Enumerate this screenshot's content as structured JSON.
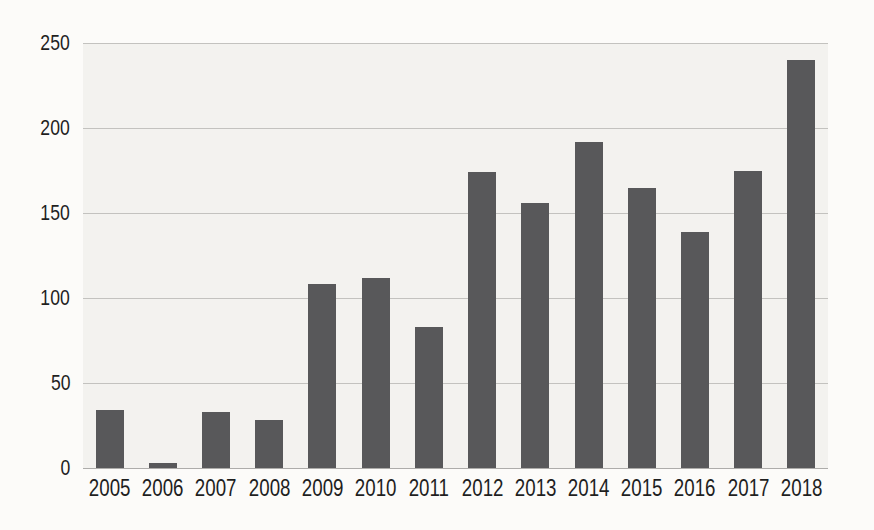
{
  "chart_data": {
    "type": "bar",
    "title": "",
    "xlabel": "",
    "ylabel": "",
    "categories": [
      "2005",
      "2006",
      "2007",
      "2008",
      "2009",
      "2010",
      "2011",
      "2012",
      "2013",
      "2014",
      "2015",
      "2016",
      "2017",
      "2018"
    ],
    "values": [
      34,
      3,
      33,
      28,
      108,
      112,
      83,
      174,
      156,
      192,
      165,
      139,
      175,
      240
    ],
    "ylim": [
      0,
      250
    ],
    "yticks": [
      0,
      50,
      100,
      150,
      200,
      250
    ],
    "grid": true,
    "legend": null,
    "colors": {
      "bar": "#58585a",
      "page_bg": "#fcfbf9",
      "plot_bg": "#f3f2ef",
      "gridline": "#c3c2bf",
      "baseline": "#adacaa",
      "text": "#1f1f1f"
    }
  }
}
